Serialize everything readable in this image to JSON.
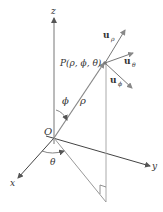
{
  "diagram": {
    "axes": {
      "x_label": "x",
      "y_label": "y",
      "z_label": "z"
    },
    "origin_label": "O",
    "point_label": "P(ρ, ϕ, θ)",
    "rho_label": "ρ",
    "phi_label": "ϕ",
    "theta_label": "θ",
    "unit_vectors": [
      {
        "base": "u",
        "sub": "ρ"
      },
      {
        "base": "u",
        "sub": "θ"
      },
      {
        "base": "u",
        "sub": "ϕ"
      }
    ],
    "colors": {
      "axis": "#333333",
      "construction": "#999999",
      "text": "#333333"
    }
  }
}
